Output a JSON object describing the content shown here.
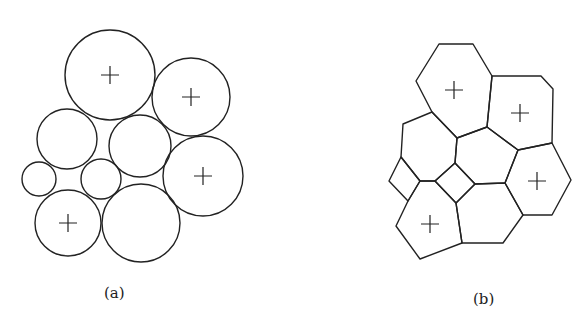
{
  "panels": [
    {
      "id": "a",
      "caption": "(a)",
      "description": "packing of circles; some marked with +"
    },
    {
      "id": "b",
      "caption": "(b)",
      "description": "polygonal tessellation; some cells marked with +"
    }
  ],
  "circles": [
    {
      "cx": 110,
      "cy": 75,
      "r": 45,
      "marked": true
    },
    {
      "cx": 191,
      "cy": 97,
      "r": 39,
      "marked": true
    },
    {
      "cx": 67,
      "cy": 139,
      "r": 30,
      "marked": false
    },
    {
      "cx": 140,
      "cy": 146,
      "r": 31,
      "marked": false
    },
    {
      "cx": 203,
      "cy": 176,
      "r": 40,
      "marked": true
    },
    {
      "cx": 39,
      "cy": 179,
      "r": 17,
      "marked": false
    },
    {
      "cx": 101,
      "cy": 179,
      "r": 20,
      "marked": false
    },
    {
      "cx": 68,
      "cy": 223,
      "r": 33,
      "marked": true
    },
    {
      "cx": 141,
      "cy": 223,
      "r": 39,
      "marked": false
    }
  ],
  "polygon_plus": [
    [
      454,
      90
    ],
    [
      520,
      113
    ],
    [
      537,
      181
    ],
    [
      430,
      224
    ]
  ],
  "captions": {
    "a": "(a)",
    "b": "(b)"
  }
}
